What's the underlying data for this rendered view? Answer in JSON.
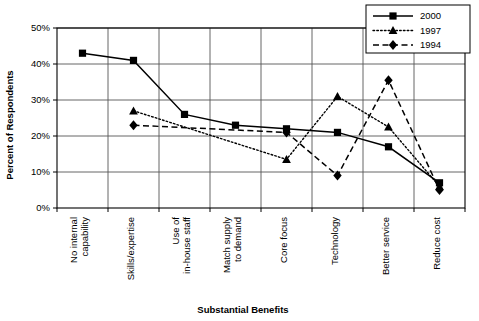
{
  "chart_data": {
    "type": "line",
    "title": "",
    "xlabel": "Substantial Benefits",
    "ylabel": "Percent of Respondents",
    "ylim": [
      0,
      50
    ],
    "yticks": [
      "0%",
      "10%",
      "20%",
      "30%",
      "40%",
      "50%"
    ],
    "ytick_values": [
      0,
      10,
      20,
      30,
      40,
      50
    ],
    "grid": true,
    "legend_position": "top-right",
    "categories": [
      "No internal capability",
      "Skills/expertise",
      "Use of in-house staff",
      "Match supply to demand",
      "Core focus",
      "Technology",
      "Better service",
      "Reduce cost"
    ],
    "category_lines": [
      [
        "No internal",
        "capability"
      ],
      [
        "Skills/expertise"
      ],
      [
        "Use of",
        "in-house staff"
      ],
      [
        "Match supply",
        "to demand"
      ],
      [
        "Core focus"
      ],
      [
        "Technology"
      ],
      [
        "Better service"
      ],
      [
        "Reduce cost"
      ]
    ],
    "series": [
      {
        "name": "2000",
        "marker": "square",
        "line_style": "solid",
        "color": "#000000",
        "values": [
          43,
          41,
          26,
          23,
          22,
          21,
          17,
          7
        ]
      },
      {
        "name": "1997",
        "marker": "triangle",
        "line_style": "dotted",
        "color": "#000000",
        "values": [
          null,
          27,
          null,
          null,
          13.5,
          31,
          22.5,
          6
        ]
      },
      {
        "name": "1994",
        "marker": "diamond",
        "line_style": "dashed",
        "color": "#000000",
        "values": [
          null,
          23,
          null,
          null,
          21,
          9,
          35.5,
          5
        ]
      }
    ]
  },
  "legend": {
    "entries": [
      {
        "label": "2000"
      },
      {
        "label": "1997"
      },
      {
        "label": "1994"
      }
    ]
  }
}
